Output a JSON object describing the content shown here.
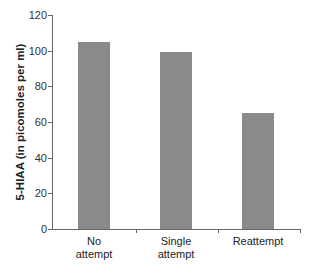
{
  "chart_data": {
    "type": "bar",
    "title": "",
    "xlabel": "",
    "ylabel": "5-HIAA (in picomoles per ml)",
    "categories": [
      "No attempt",
      "Single attempt",
      "Reattempt"
    ],
    "category_lines": [
      [
        "No",
        "attempt"
      ],
      [
        "Single",
        "attempt"
      ],
      [
        "Reattempt",
        ""
      ]
    ],
    "values": [
      105,
      99,
      65
    ],
    "ylim": [
      0,
      120
    ],
    "yticks": [
      0,
      20,
      40,
      60,
      80,
      100,
      120
    ],
    "grid": false,
    "legend": null,
    "bar_color": "#8a8a8a"
  }
}
